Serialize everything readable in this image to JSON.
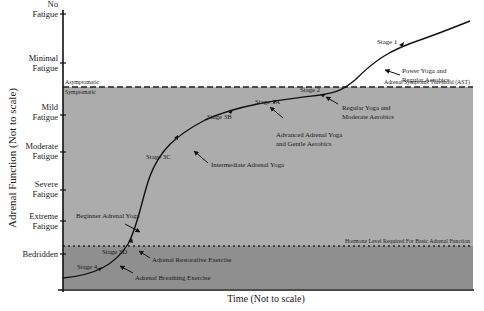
{
  "figure": {
    "y_axis_title": "Adrenal Function (Not to scale)",
    "x_axis_title": "Time (Not to scale)",
    "y_levels": [
      {
        "line1": "No",
        "line2": "Fatigue"
      },
      {
        "line1": "Minimal",
        "line2": "Fatigue"
      },
      {
        "line1": "Mild",
        "line2": "Fatigue"
      },
      {
        "line1": "Moderate",
        "line2": "Fatigue"
      },
      {
        "line1": "Severe",
        "line2": "Fatigue"
      },
      {
        "line1": "Extreme",
        "line2": "Fatigue"
      },
      {
        "line1": "Bedridden",
        "line2": ""
      }
    ],
    "thresholds": {
      "ast_label": "Adrenal Symptoms Threshold (AST)",
      "above_label": "Asymptomatic",
      "below_label": "Symptomatic",
      "basic_label": "Hormone Level Required For Basic Adrenal Function"
    },
    "stages": [
      {
        "name": "Stage 1",
        "exercise_line1": "Power Yoga and",
        "exercise_line2": "Regular Aerobics"
      },
      {
        "name": "Stage 2",
        "exercise_line1": "Regular Yoga and",
        "exercise_line2": "Moderate Aerobics"
      },
      {
        "name": "Stage 3A",
        "exercise_line1": "Advanced Adrenal Yoga",
        "exercise_line2": "and Gentle Aerobics"
      },
      {
        "name": "Stage 3B",
        "exercise_line1": "",
        "exercise_line2": ""
      },
      {
        "name": "Stage 3C",
        "exercise_line1": "Intermediate Adrenal Yoga",
        "exercise_line2": ""
      },
      {
        "name": "Stage 3D",
        "exercise_line1": "Adrenal Restorative Exercise",
        "exercise_line2": ""
      },
      {
        "name": "Stage 4",
        "exercise_line1": "Adrenal Breathing Exercise",
        "exercise_line2": ""
      }
    ],
    "extra_notes": {
      "beginner": "Beginner Adrenal Yoga"
    },
    "colors": {
      "symptomatic_zone": "#a9a9a9",
      "basic_zone": "#8e8e8e",
      "curve": "#111111",
      "background": "#ffffff"
    }
  }
}
